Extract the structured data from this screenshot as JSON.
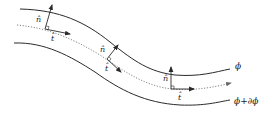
{
  "figure": {
    "colors": {
      "stroke": "#2a2a2a",
      "dotted": "#777777",
      "background": "#ffffff"
    },
    "curves": {
      "top": {
        "label": "ϕ"
      },
      "middle": {
        "style": "dotted",
        "label": ""
      },
      "bottom": {
        "label": "ϕ+∂ϕ"
      }
    },
    "vectors": [
      {
        "normal_label": "n̂",
        "tangent_label": "t̂"
      },
      {
        "normal_label": "n̂",
        "tangent_label": "t̂"
      },
      {
        "normal_label": "n̂",
        "tangent_label": "t̂"
      }
    ]
  }
}
